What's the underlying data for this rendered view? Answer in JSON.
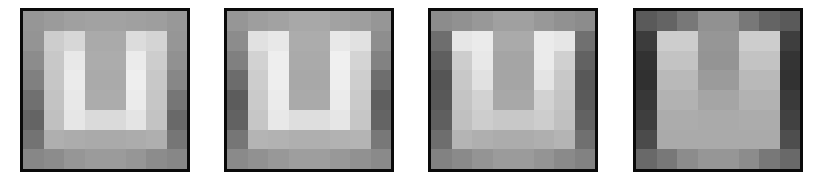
{
  "figure": {
    "grid_size": [
      8,
      8
    ],
    "panels": [
      {
        "id": "panel-1",
        "left": 20,
        "grid": [
          [
            150,
            155,
            160,
            162,
            162,
            160,
            158,
            152
          ],
          [
            148,
            205,
            215,
            170,
            170,
            220,
            212,
            150
          ],
          [
            140,
            200,
            232,
            172,
            172,
            235,
            205,
            145
          ],
          [
            128,
            198,
            235,
            170,
            170,
            238,
            200,
            135
          ],
          [
            112,
            195,
            232,
            172,
            172,
            235,
            198,
            118
          ],
          [
            100,
            192,
            230,
            218,
            218,
            228,
            195,
            105
          ],
          [
            115,
            175,
            172,
            170,
            170,
            172,
            175,
            118
          ],
          [
            135,
            140,
            150,
            155,
            155,
            150,
            140,
            135
          ]
        ]
      },
      {
        "id": "panel-2",
        "left": 224,
        "grid": [
          [
            150,
            158,
            162,
            168,
            168,
            162,
            158,
            150
          ],
          [
            140,
            225,
            232,
            172,
            172,
            232,
            225,
            142
          ],
          [
            128,
            210,
            238,
            170,
            170,
            240,
            212,
            130
          ],
          [
            108,
            205,
            238,
            168,
            168,
            238,
            206,
            110
          ],
          [
            92,
            202,
            235,
            170,
            170,
            235,
            202,
            95
          ],
          [
            98,
            198,
            232,
            222,
            222,
            230,
            198,
            100
          ],
          [
            118,
            180,
            178,
            175,
            175,
            178,
            180,
            120
          ],
          [
            138,
            145,
            152,
            158,
            158,
            152,
            145,
            138
          ]
        ]
      },
      {
        "id": "panel-3",
        "left": 428,
        "grid": [
          [
            140,
            145,
            152,
            160,
            160,
            152,
            145,
            140
          ],
          [
            110,
            230,
            235,
            170,
            170,
            235,
            230,
            112
          ],
          [
            95,
            205,
            232,
            165,
            165,
            235,
            208,
            98
          ],
          [
            85,
            200,
            225,
            165,
            165,
            228,
            200,
            88
          ],
          [
            88,
            196,
            210,
            168,
            168,
            210,
            196,
            90
          ],
          [
            95,
            192,
            205,
            200,
            200,
            205,
            192,
            98
          ],
          [
            110,
            180,
            175,
            172,
            172,
            175,
            180,
            112
          ],
          [
            130,
            138,
            148,
            155,
            155,
            148,
            138,
            130
          ]
        ]
      },
      {
        "id": "panel-4",
        "left": 633,
        "grid": [
          [
            90,
            100,
            120,
            145,
            145,
            120,
            100,
            90
          ],
          [
            60,
            205,
            205,
            150,
            150,
            205,
            205,
            62
          ],
          [
            50,
            195,
            195,
            148,
            148,
            195,
            195,
            52
          ],
          [
            48,
            185,
            185,
            155,
            155,
            185,
            185,
            50
          ],
          [
            55,
            178,
            178,
            165,
            165,
            178,
            178,
            58
          ],
          [
            62,
            172,
            172,
            170,
            170,
            172,
            172,
            65
          ],
          [
            75,
            170,
            170,
            170,
            170,
            170,
            170,
            78
          ],
          [
            105,
            120,
            140,
            150,
            150,
            140,
            120,
            105
          ]
        ]
      }
    ],
    "border_color": "#0a0a0a",
    "background_color": "#ffffff"
  }
}
